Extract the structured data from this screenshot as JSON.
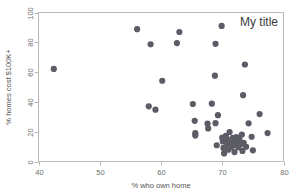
{
  "chart_data": {
    "type": "scatter",
    "title": "My title",
    "xlabel": "% who own home",
    "ylabel": "% homes cost $100K+",
    "xlim": [
      40,
      80
    ],
    "ylim": [
      0,
      100
    ],
    "xticks": [
      40,
      50,
      60,
      70,
      80
    ],
    "yticks": [
      0,
      20,
      40,
      60,
      80,
      100
    ],
    "xtick_labels": [
      "40",
      "50",
      "60",
      "70",
      "80"
    ],
    "ytick_labels": [
      "0",
      "20",
      "40",
      "60",
      "80",
      "100"
    ],
    "grid": false,
    "legend": "none",
    "title_position": "top-right-inside",
    "marker": {
      "shape": "circle",
      "color": "#5c5c66",
      "size": 3.1
    },
    "series": [
      {
        "name": "states",
        "points": [
          [
            42.5,
            62.1
          ],
          [
            56.1,
            88.8
          ],
          [
            58.3,
            78.7
          ],
          [
            58.0,
            37.0
          ],
          [
            59.1,
            34.8
          ],
          [
            60.2,
            54.2
          ],
          [
            62.6,
            79.5
          ],
          [
            63.0,
            86.9
          ],
          [
            65.2,
            38.6
          ],
          [
            65.5,
            27.3
          ],
          [
            65.6,
            19.0
          ],
          [
            65.6,
            17.4
          ],
          [
            67.6,
            25.4
          ],
          [
            67.7,
            22.2
          ],
          [
            68.3,
            38.8
          ],
          [
            68.8,
            57.6
          ],
          [
            68.9,
            79.0
          ],
          [
            68.9,
            25.7
          ],
          [
            69.1,
            10.9
          ],
          [
            69.3,
            31.1
          ],
          [
            69.9,
            91.0
          ],
          [
            70.0,
            16.0
          ],
          [
            70.1,
            13.5
          ],
          [
            70.2,
            9.1
          ],
          [
            70.3,
            5.4
          ],
          [
            70.5,
            15.5
          ],
          [
            70.6,
            17.2
          ],
          [
            70.8,
            11.8
          ],
          [
            70.9,
            14.6
          ],
          [
            71.0,
            7.9
          ],
          [
            71.2,
            19.8
          ],
          [
            71.4,
            12.3
          ],
          [
            71.5,
            9.7
          ],
          [
            71.7,
            15.9
          ],
          [
            71.8,
            13.0
          ],
          [
            72.0,
            6.3
          ],
          [
            72.1,
            11.1
          ],
          [
            72.3,
            16.4
          ],
          [
            72.5,
            13.8
          ],
          [
            72.6,
            9.5
          ],
          [
            72.8,
            15.1
          ],
          [
            73.0,
            11.6
          ],
          [
            73.2,
            18.1
          ],
          [
            73.3,
            7.1
          ],
          [
            73.4,
            44.5
          ],
          [
            73.5,
            12.5
          ],
          [
            73.7,
            65.1
          ],
          [
            73.9,
            9.9
          ],
          [
            74.3,
            25.6
          ],
          [
            74.8,
            16.6
          ],
          [
            75.0,
            7.5
          ],
          [
            76.1,
            31.8
          ],
          [
            77.4,
            19.1
          ]
        ]
      }
    ]
  }
}
